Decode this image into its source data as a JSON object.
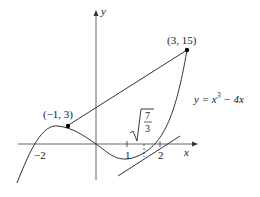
{
  "figure": {
    "function_label": "y = x³ − 4x",
    "function_label_parts": {
      "lhs": "y = x",
      "exp": "3",
      "rhs": " − 4x"
    },
    "axis_labels": {
      "x": "x",
      "y": "y"
    },
    "tick_labels": {
      "neg2": "−2",
      "one": "1",
      "two": "2"
    },
    "points": [
      {
        "label": "(−1, 3)",
        "x": -1,
        "y": 3
      },
      {
        "label": "(3, 15)",
        "x": 3,
        "y": 15
      }
    ],
    "tangent_point_label": {
      "radicand_num": "7",
      "radicand_den": "3",
      "text": "√(7/3)"
    },
    "colors": {
      "stroke": "#333333",
      "point": "#000000"
    }
  }
}
